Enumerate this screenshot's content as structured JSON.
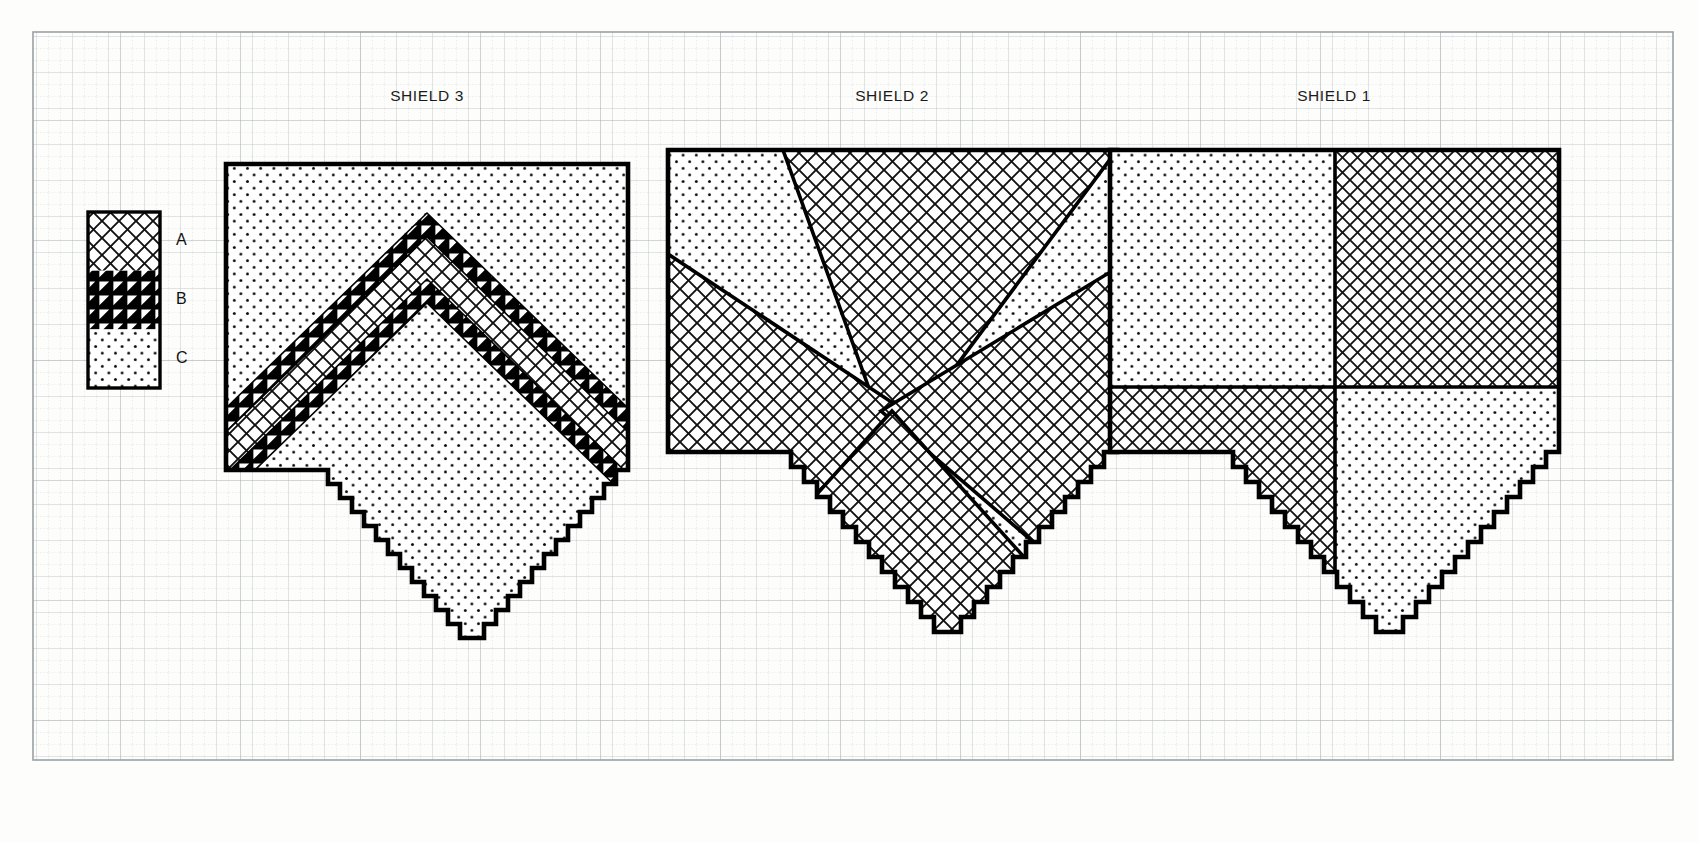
{
  "sheet": {
    "background_color": "#fdfdfc",
    "grid": {
      "fine_color": "#dfe2e4",
      "medium_color": "#cfd4d7",
      "major_color": "#b3b9bd",
      "fine_step": 12,
      "medium_step": 36,
      "major_step": 120,
      "frame_color": "#9aa0a4"
    },
    "frame": {
      "x": 33,
      "y": 32,
      "width": 1640,
      "height": 728
    }
  },
  "legend": {
    "name": "pattern-key",
    "x": 88,
    "y": 212,
    "width": 72,
    "height": 176,
    "swatches": [
      {
        "key": "A",
        "label": "A",
        "pattern": "crosshatch-diamond"
      },
      {
        "key": "B",
        "label": "B",
        "pattern": "solid-black-triangles"
      },
      {
        "key": "C",
        "label": "C",
        "pattern": "dots"
      }
    ]
  },
  "shields": [
    {
      "id": "shield-3",
      "title": "SHIELD 3",
      "title_x": 427,
      "title_y": 95,
      "x": 226,
      "y": 164,
      "width": 402,
      "height": 508,
      "field_pattern": "C",
      "charge": "chevron",
      "charge_pattern": "A",
      "charge_border_pattern": "B",
      "description": "Chevron of pattern A with pattern B border on pattern C field"
    },
    {
      "id": "shield-2",
      "title": "SHIELD 2",
      "title_x": 892,
      "title_y": 95,
      "x": 668,
      "y": 150,
      "width": 449,
      "height": 522,
      "field_pattern": "C",
      "charge": "four-triangles",
      "charge_pattern": "A",
      "description": "Four pattern A triangles pointing inward on pattern C field"
    },
    {
      "id": "shield-1",
      "title": "SHIELD 1",
      "title_x": 1334,
      "title_y": 95,
      "x": 1110,
      "y": 150,
      "width": 449,
      "height": 522,
      "field_pattern": "quartered",
      "quarters": [
        {
          "position": "top-left",
          "pattern": "C"
        },
        {
          "position": "top-right",
          "pattern": "A"
        },
        {
          "position": "bottom-left",
          "pattern": "A"
        },
        {
          "position": "bottom-right",
          "pattern": "C"
        }
      ],
      "description": "Quartered shield: C, A / A, C"
    }
  ],
  "colors": {
    "ink": "#000000",
    "paper": "#fdfdfc",
    "grid_light": "#dfe2e4",
    "grid_major": "#b3b9bd"
  }
}
